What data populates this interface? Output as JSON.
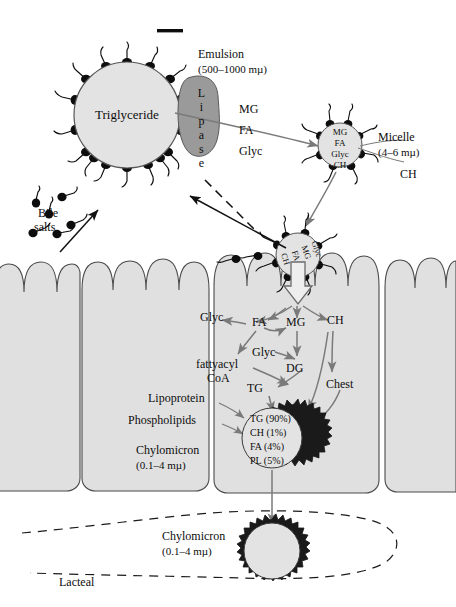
{
  "figure": {
    "title_hidden": "Intestinal fat digestion and absorption",
    "scalebar": {
      "name": "scale-bar"
    }
  },
  "emulsion": {
    "droplet_label": "Triglyceride",
    "caption_line1": "Emulsion",
    "caption_line2": "(500–1000 mµ)",
    "enzyme_label": "Lipase",
    "products": [
      "MG",
      "FA",
      "Glyc"
    ]
  },
  "bile": {
    "label_line1": "Bile",
    "label_line2": "salts"
  },
  "micelle": {
    "contents": [
      "MG",
      "FA",
      "Glyc",
      "CH"
    ],
    "caption_line1": "Micelle",
    "caption_line2": "(4–6 mµ)",
    "ch_label": "CH"
  },
  "membrane_micelle": {
    "contents": [
      "Glyc",
      "MG",
      "FA",
      "CH"
    ]
  },
  "cell_pathway": {
    "nodes": [
      {
        "id": "glyc1",
        "label": "Glyc"
      },
      {
        "id": "fa",
        "label": "FA"
      },
      {
        "id": "mg",
        "label": "MG"
      },
      {
        "id": "ch",
        "label": "CH"
      },
      {
        "id": "glyc2",
        "label": "Glyc"
      },
      {
        "id": "fattyacyl",
        "label": "fattyacyl"
      },
      {
        "id": "coa",
        "label": "CoA"
      },
      {
        "id": "dg",
        "label": "DG"
      },
      {
        "id": "tg",
        "label": "TG"
      },
      {
        "id": "chest",
        "label": "Chest"
      }
    ]
  },
  "chylomicron_cell": {
    "composition": [
      "TG (90%)",
      "CH (1%)",
      "FA (4%)",
      "PL (5%)"
    ],
    "label_lipoprotein": "Lipoprotein",
    "label_phospholipids": "Phospholipids",
    "caption_line1": "Chylomicron",
    "caption_line2": "(0.1–4 mµ)"
  },
  "lacteal": {
    "chylomicron_caption_line1": "Chylomicron",
    "chylomicron_caption_line2": "(0.1–4 mµ)",
    "label": "Lacteal"
  },
  "colors": {
    "droplet_fill": "#e3e3e3",
    "droplet_stroke": "#555555",
    "lipase_fill": "#9a9a9a",
    "cell_fill": "#e0e0e0",
    "cell_stroke": "#4a4a4a",
    "arrow_gray": "#7a7a7a",
    "arrow_black": "#111111",
    "bile_head": "#0d0d0d",
    "background": "#ffffff"
  }
}
